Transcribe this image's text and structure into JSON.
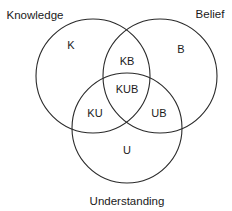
{
  "diagram": {
    "type": "venn",
    "sets": [
      {
        "id": "K",
        "label": "Knowledge"
      },
      {
        "id": "B",
        "label": "Belief"
      },
      {
        "id": "U",
        "label": "Understanding"
      }
    ],
    "regions": {
      "K": "K",
      "B": "B",
      "U": "U",
      "KB": "KB",
      "KU": "KU",
      "UB": "UB",
      "KUB": "KUB"
    },
    "stroke_color": "#2a2a2a",
    "background": "#ffffff"
  }
}
